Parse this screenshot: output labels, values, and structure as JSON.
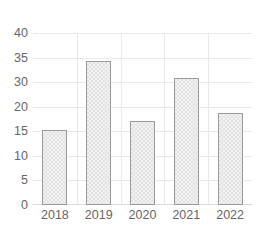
{
  "chart_data": {
    "type": "bar",
    "title": "",
    "subtitle": "",
    "xlabel": "",
    "ylabel": "",
    "categories": [
      "2018",
      "2019",
      "2020",
      "2021",
      "2022"
    ],
    "values": [
      17.5,
      33.5,
      19.5,
      29.5,
      21.5
    ],
    "series": [
      {
        "name": "",
        "values": [
          17.5,
          33.5,
          19.5,
          29.5,
          21.5
        ]
      }
    ],
    "ylim": [
      0,
      40
    ],
    "y_tick_labels": [
      "40",
      "35",
      "30",
      "20",
      "15",
      "10",
      "5",
      "0"
    ],
    "y_tick_values": [
      40,
      35,
      30,
      25,
      15,
      10,
      5,
      0
    ],
    "x_tick_labels": [
      "2018",
      "2019",
      "2020",
      "2021",
      "2022"
    ],
    "grid": true,
    "grid_horizontal": true,
    "grid_vertical": true,
    "legend": false,
    "legend_position": "none",
    "annotations": [],
    "colors": {
      "bar_fill": "#f2f2f2",
      "bar_pattern": "#e2e2e3",
      "bar_border": "#9a9a9c",
      "gridline": "#e9e9ea",
      "axis_line": "#dcdcdd",
      "tick_label": "#666668",
      "background": "#ffffff"
    }
  }
}
